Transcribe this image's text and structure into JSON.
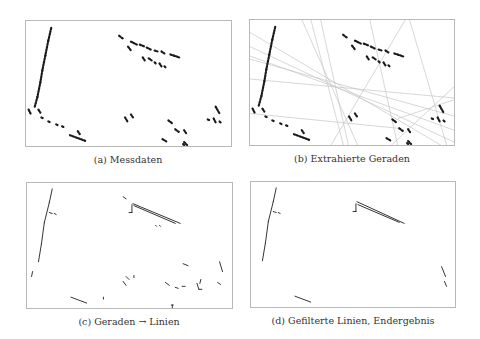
{
  "figure": {
    "panels": [
      {
        "id": "a",
        "caption": "(a) Messdaten",
        "frame": {
          "x": 25,
          "y": 20,
          "w": 207,
          "h": 127
        },
        "caption_pos": {
          "x": 128,
          "y": 154
        },
        "kind": "points"
      },
      {
        "id": "b",
        "caption": "(b) Extrahierte Geraden",
        "frame": {
          "x": 249,
          "y": 19,
          "w": 206,
          "h": 127
        },
        "caption_pos": {
          "x": 352,
          "y": 153
        },
        "kind": "points+lines"
      },
      {
        "id": "c",
        "caption": "(c) Geraden → Linien",
        "frame": {
          "x": 26,
          "y": 182,
          "w": 207,
          "h": 127
        },
        "caption_pos": {
          "x": 129,
          "y": 316
        },
        "kind": "segments"
      },
      {
        "id": "d",
        "caption": "(d) Gefilterte Linien, Endergebnis",
        "frame": {
          "x": 250,
          "y": 181,
          "w": 206,
          "h": 127
        },
        "caption_pos": {
          "x": 353,
          "y": 315
        },
        "kind": "segments-filtered"
      }
    ],
    "colors": {
      "ink": "#1a1a1a",
      "faint_line": "#c4c4c4",
      "frame": "#b8b8b8"
    }
  },
  "shapes": {
    "points": [
      [
        25,
        7,
        22,
        20
      ],
      [
        22,
        20,
        19,
        35
      ],
      [
        19,
        35,
        16,
        50
      ],
      [
        16,
        50,
        14,
        62
      ],
      [
        14,
        62,
        11,
        77
      ],
      [
        11,
        77,
        8,
        88
      ],
      [
        2,
        90,
        4,
        94
      ],
      [
        12,
        90,
        14,
        93
      ],
      [
        15,
        98,
        17,
        99
      ],
      [
        22,
        102,
        24,
        103
      ],
      [
        30,
        105,
        32,
        106
      ],
      [
        36,
        107,
        38,
        108
      ],
      [
        44,
        116,
        60,
        122
      ],
      [
        52,
        112,
        54,
        115
      ],
      [
        94,
        15,
        98,
        18
      ],
      [
        106,
        21,
        112,
        24
      ],
      [
        115,
        24,
        120,
        26
      ],
      [
        122,
        27,
        126,
        29
      ],
      [
        130,
        30,
        133,
        31
      ],
      [
        137,
        31,
        140,
        33
      ],
      [
        146,
        34,
        155,
        37
      ],
      [
        103,
        26,
        106,
        30
      ],
      [
        118,
        37,
        120,
        40
      ],
      [
        124,
        38,
        127,
        40
      ],
      [
        130,
        42,
        132,
        44
      ],
      [
        135,
        43,
        137,
        46
      ],
      [
        140,
        46,
        142,
        48
      ],
      [
        100,
        98,
        103,
        103
      ],
      [
        106,
        95,
        108,
        98
      ],
      [
        144,
        101,
        148,
        104
      ],
      [
        138,
        120,
        143,
        123
      ],
      [
        151,
        110,
        155,
        113
      ],
      [
        160,
        111,
        162,
        114
      ],
      [
        158,
        128,
        161,
        133
      ],
      [
        159,
        125,
        160,
        126
      ],
      [
        160,
        123,
        163,
        126
      ],
      [
        192,
        87,
        196,
        94
      ],
      [
        184,
        100,
        186,
        101
      ],
      [
        190,
        99,
        192,
        103
      ],
      [
        196,
        102,
        198,
        104
      ]
    ],
    "lines_b": [
      [
        -5,
        10,
        215,
        140
      ],
      [
        -5,
        25,
        215,
        128
      ],
      [
        -5,
        35,
        215,
        115
      ],
      [
        0,
        40,
        215,
        100
      ],
      [
        0,
        60,
        215,
        80
      ],
      [
        50,
        -5,
        110,
        130
      ],
      [
        60,
        -5,
        95,
        130
      ],
      [
        70,
        -5,
        100,
        130
      ],
      [
        0,
        95,
        150,
        110
      ],
      [
        120,
        -5,
        150,
        130
      ],
      [
        160,
        -5,
        200,
        130
      ],
      [
        150,
        100,
        210,
        80
      ],
      [
        80,
        130,
        160,
        -5
      ],
      [
        140,
        130,
        215,
        60
      ]
    ],
    "segments_c": [
      [
        25,
        6,
        22,
        20
      ],
      [
        22,
        20,
        17,
        40
      ],
      [
        17,
        40,
        14,
        62
      ],
      [
        14,
        62,
        11,
        80
      ],
      [
        5,
        90,
        4,
        95
      ],
      [
        22,
        30,
        25,
        31
      ],
      [
        27,
        31,
        29,
        32
      ],
      [
        97,
        14,
        100,
        16
      ],
      [
        107,
        21,
        155,
        41
      ],
      [
        108,
        23,
        150,
        41
      ],
      [
        106,
        22,
        106,
        30
      ],
      [
        103,
        30,
        106,
        30
      ],
      [
        130,
        43,
        131,
        44
      ],
      [
        134,
        43,
        135,
        44
      ],
      [
        158,
        82,
        163,
        84
      ],
      [
        172,
        102,
        174,
        108
      ],
      [
        174,
        108,
        177,
        108
      ],
      [
        176,
        98,
        175,
        102
      ],
      [
        100,
        95,
        103,
        98
      ],
      [
        97,
        100,
        100,
        104
      ],
      [
        108,
        94,
        108,
        96
      ],
      [
        140,
        101,
        144,
        104
      ],
      [
        150,
        106,
        153,
        107
      ],
      [
        157,
        105,
        160,
        105
      ],
      [
        195,
        80,
        198,
        90
      ],
      [
        193,
        101,
        196,
        103
      ],
      [
        44,
        116,
        60,
        122
      ],
      [
        77,
        116,
        77,
        118
      ],
      [
        146,
        124,
        148,
        124
      ],
      [
        147,
        124,
        147,
        128
      ]
    ],
    "segments_d": [
      [
        25,
        6,
        22,
        20
      ],
      [
        22,
        20,
        17,
        40
      ],
      [
        17,
        40,
        14,
        62
      ],
      [
        14,
        62,
        11,
        80
      ],
      [
        22,
        30,
        25,
        31
      ],
      [
        27,
        31,
        29,
        32
      ],
      [
        107,
        20,
        155,
        42
      ],
      [
        108,
        23,
        150,
        41
      ],
      [
        106,
        22,
        106,
        30
      ],
      [
        103,
        30,
        106,
        30
      ],
      [
        193,
        86,
        197,
        96
      ],
      [
        196,
        101,
        198,
        106
      ],
      [
        44,
        116,
        60,
        122
      ]
    ]
  }
}
